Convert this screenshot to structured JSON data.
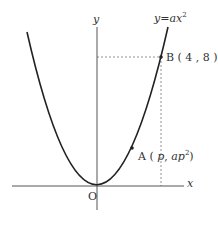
{
  "figure": {
    "type": "coordinate-plane-parabola",
    "curve_label": "y = ax²",
    "axes": {
      "x_label": "x",
      "y_label": "y",
      "origin_label": "O"
    },
    "points": [
      {
        "name": "A",
        "label": "A ( p , ap² )",
        "coords": "(p, ap²)"
      },
      {
        "name": "B",
        "label": "B ( 4 , 8 )",
        "coords": [
          4,
          8
        ]
      }
    ],
    "guides": [
      "dashed horizontal from y-axis to B",
      "dashed vertical from B to x-axis"
    ],
    "colors": {
      "curve": "#222222",
      "axis": "#555555",
      "dashed": "#777777",
      "text": "#333333"
    }
  },
  "labels": {
    "y_axis": "y",
    "x_axis": "x",
    "origin": "O",
    "curve_y": "y",
    "curve_eq": "=",
    "curve_a": "ax",
    "curve_exp": "2",
    "point_b": "B ( 4 , 8 )",
    "point_a_prefix": "A (",
    "point_a_p": "p",
    "point_a_mid": ", ",
    "point_a_ap": "ap",
    "point_a_exp": "2",
    "point_a_suffix": ")"
  }
}
